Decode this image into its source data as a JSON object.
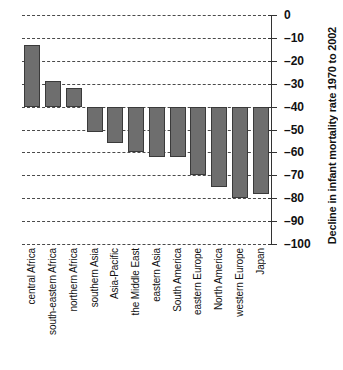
{
  "chart_data": {
    "type": "bar",
    "title": "",
    "xlabel": "",
    "ylabel": "Decline in infant mortality rate 1970 to 2002",
    "ylim": [
      -100,
      0
    ],
    "yticks": [
      0,
      -10,
      -20,
      -30,
      -40,
      -50,
      -60,
      -70,
      -80,
      -90,
      -100
    ],
    "ytick_labels": [
      "0",
      "–10",
      "–20",
      "–30",
      "–40",
      "–50",
      "–60",
      "–70",
      "–80",
      "–90",
      "–100"
    ],
    "grid": true,
    "legend": "none",
    "baseline": -40,
    "bar_color": "#6e6e6e",
    "bar_edge_color": "#3a3a3a",
    "categories": [
      "central Africa",
      "south-eastern Africa",
      "northern Africa",
      "southern Asia",
      "Asia-Pacific",
      "the Middle East",
      "eastern Asia",
      "South America",
      "eastern Europe",
      "North America",
      "western Europe",
      "Japan"
    ],
    "values": [
      -13,
      -29,
      -32,
      -51,
      -56,
      -60,
      -62,
      -62,
      -70,
      -75,
      -80,
      -78
    ]
  },
  "axis": {
    "y_title": "Decline in infant mortality rate 1970 to 2002"
  }
}
